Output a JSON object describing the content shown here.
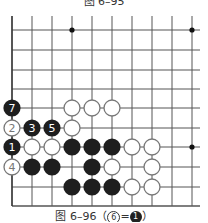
{
  "top_caption": "图 6–95",
  "caption": {
    "prefix": "图 6–96（",
    "white_num": "6",
    "equals": "=",
    "black_num": "1",
    "suffix": "）"
  },
  "board": {
    "columns_x": [
      12,
      32,
      52,
      72,
      92,
      112,
      132,
      152,
      172,
      192
    ],
    "rows_y": [
      30,
      50,
      70,
      89,
      108,
      128,
      147,
      167,
      187,
      206
    ],
    "right_edge": 200,
    "line_color": "#555555",
    "star_points": [
      [
        3,
        0
      ],
      [
        9,
        0
      ],
      [
        9,
        6
      ]
    ],
    "stones": [
      {
        "col": 0,
        "row": 4,
        "color": "black",
        "label": "7"
      },
      {
        "col": 3,
        "row": 4,
        "color": "white",
        "label": ""
      },
      {
        "col": 4,
        "row": 4,
        "color": "white",
        "label": ""
      },
      {
        "col": 5,
        "row": 4,
        "color": "white",
        "label": ""
      },
      {
        "col": 0,
        "row": 5,
        "color": "white",
        "label": "2"
      },
      {
        "col": 1,
        "row": 5,
        "color": "black",
        "label": "3"
      },
      {
        "col": 2,
        "row": 5,
        "color": "black",
        "label": "5"
      },
      {
        "col": 3,
        "row": 5,
        "color": "white",
        "label": ""
      },
      {
        "col": 0,
        "row": 6,
        "color": "black",
        "label": "1"
      },
      {
        "col": 1,
        "row": 6,
        "color": "white",
        "label": ""
      },
      {
        "col": 2,
        "row": 6,
        "color": "white",
        "label": ""
      },
      {
        "col": 3,
        "row": 6,
        "color": "black",
        "label": ""
      },
      {
        "col": 4,
        "row": 6,
        "color": "black",
        "label": ""
      },
      {
        "col": 5,
        "row": 6,
        "color": "black",
        "label": ""
      },
      {
        "col": 6,
        "row": 6,
        "color": "white",
        "label": ""
      },
      {
        "col": 7,
        "row": 6,
        "color": "white",
        "label": ""
      },
      {
        "col": 0,
        "row": 7,
        "color": "white",
        "label": "4"
      },
      {
        "col": 1,
        "row": 7,
        "color": "black",
        "label": ""
      },
      {
        "col": 2,
        "row": 7,
        "color": "black",
        "label": ""
      },
      {
        "col": 4,
        "row": 7,
        "color": "black",
        "label": ""
      },
      {
        "col": 5,
        "row": 7,
        "color": "white",
        "label": ""
      },
      {
        "col": 7,
        "row": 7,
        "color": "white",
        "label": ""
      },
      {
        "col": 3,
        "row": 8,
        "color": "black",
        "label": ""
      },
      {
        "col": 4,
        "row": 8,
        "color": "black",
        "label": ""
      },
      {
        "col": 5,
        "row": 8,
        "color": "black",
        "label": ""
      },
      {
        "col": 6,
        "row": 8,
        "color": "white",
        "label": ""
      },
      {
        "col": 7,
        "row": 8,
        "color": "white",
        "label": ""
      }
    ]
  }
}
